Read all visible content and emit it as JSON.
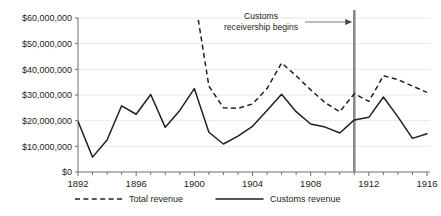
{
  "chart_data": {
    "type": "line",
    "title": "",
    "xlabel": "",
    "ylabel": "",
    "xlim": [
      1892,
      1916
    ],
    "ylim": [
      0,
      60000000
    ],
    "grid": true,
    "legend_position": "bottom",
    "y_ticks": [
      0,
      10000000,
      20000000,
      30000000,
      40000000,
      50000000,
      60000000
    ],
    "y_tick_labels": [
      "$0",
      "$10,000,000",
      "$20,000,000",
      "$30,000,000",
      "$40,000,000",
      "$50,000,000",
      "$60,000,000"
    ],
    "x_ticks": [
      1892,
      1896,
      1900,
      1904,
      1908,
      1912,
      1916
    ],
    "x_tick_labels": [
      "1892",
      "1896",
      "1900",
      "1904",
      "1908",
      "1912",
      "1916"
    ],
    "x_minor_ticks": [
      1893,
      1894,
      1895,
      1897,
      1898,
      1899,
      1901,
      1902,
      1903,
      1905,
      1906,
      1907,
      1909,
      1910,
      1911,
      1913,
      1914,
      1915
    ],
    "series": [
      {
        "name": "Total revenue",
        "style": "dashed",
        "color": "#231f20",
        "note": "Begins 1900 above the top of the axis (off-scale)",
        "x": [
          1900,
          1901,
          1902,
          1903,
          1904,
          1905,
          1906,
          1907,
          1908,
          1909,
          1910,
          1911,
          1912,
          1913,
          1914,
          1915,
          1916
        ],
        "values": [
          69000000,
          33500000,
          25000000,
          24800000,
          26500000,
          32500000,
          42500000,
          37500000,
          32000000,
          27000000,
          23500000,
          30500000,
          27500000,
          37500000,
          36000000,
          33500000,
          31000000
        ]
      },
      {
        "name": "Customs revenue",
        "style": "solid",
        "color": "#231f20",
        "x": [
          1892,
          1893,
          1894,
          1895,
          1896,
          1897,
          1898,
          1899,
          1900,
          1901,
          1902,
          1903,
          1904,
          1905,
          1906,
          1907,
          1908,
          1909,
          1910,
          1911,
          1912,
          1913,
          1914,
          1915,
          1916
        ],
        "values": [
          19800000,
          5800000,
          12500000,
          25800000,
          22500000,
          30200000,
          17400000,
          24000000,
          32500000,
          15500000,
          10900000,
          14000000,
          17800000,
          24000000,
          30300000,
          23500000,
          18700000,
          17500000,
          15200000,
          20300000,
          21300000,
          29200000,
          21500000,
          13100000,
          14900000
        ]
      }
    ],
    "annotations": [
      {
        "name": "customs-receivership",
        "text_line1": "Customs",
        "text_line2": "receivership begins",
        "marker_x": 1911,
        "marker_color": "#8a8a8a",
        "arrow": "right"
      }
    ]
  },
  "legend": {
    "items": [
      {
        "label": "Total revenue",
        "style": "dashed"
      },
      {
        "label": "Customs revenue",
        "style": "solid"
      }
    ]
  }
}
